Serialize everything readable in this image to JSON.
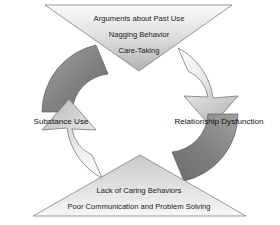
{
  "diagram": {
    "type": "cyclical-feedback-loop",
    "title_text_lines": [],
    "nodes": [
      {
        "id": "top",
        "shape": "downward-triangle",
        "lines": [
          "Arguments about Past Use",
          "Nagging Behavior",
          "Care-Taking"
        ]
      },
      {
        "id": "bottom",
        "shape": "upward-triangle",
        "lines": [
          "Lack of Caring Behaviors",
          "Poor Communication and Problem Solving"
        ]
      }
    ],
    "side_labels": [
      {
        "id": "left",
        "label": "Substance Use"
      },
      {
        "id": "right",
        "label": "Relationship Dysfunction"
      }
    ],
    "arrows": [
      {
        "id": "upper-left",
        "tone": "dark",
        "direction": "up-right",
        "has_arrowhead": false
      },
      {
        "id": "upper-right",
        "tone": "light",
        "direction": "down-right",
        "has_arrowhead": true
      },
      {
        "id": "lower-right",
        "tone": "dark",
        "direction": "down-left",
        "has_arrowhead": false
      },
      {
        "id": "lower-left",
        "tone": "light",
        "direction": "up-left",
        "has_arrowhead": true
      }
    ],
    "colors": {
      "background": "#ffffff",
      "text": "#1c1c1c",
      "triangle_fill_light": "#f4f4f4",
      "triangle_fill_mid": "#bdbdbd",
      "arrow_dark_light_stop": "#9a9a9a",
      "arrow_dark_dark_stop": "#6f6f6f",
      "arrow_light_light_stop": "#fdfdfd",
      "arrow_light_dark_stop": "#bcbcbc",
      "outline": "#5a5a5a"
    }
  }
}
